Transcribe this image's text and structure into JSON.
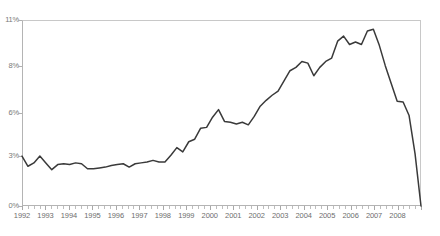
{
  "chart_data": {
    "type": "line",
    "title": "",
    "subtitle": "",
    "xlabel": "",
    "ylabel": "",
    "grid": false,
    "legend_position": "none",
    "line_color": "#3a3a3a",
    "axis_color": "#b4b4b4",
    "label_color": "#757575",
    "ylim": [
      0,
      11
    ],
    "ytick_labels": [
      "11%",
      "8%",
      "6%",
      "3%",
      "0%"
    ],
    "ytick_values": [
      11,
      8,
      6,
      3,
      0
    ],
    "ytick_pixel_y": [
      20,
      66,
      113,
      156,
      206
    ],
    "xtick_labels": [
      "1992",
      "1993",
      "1994",
      "1995",
      "1996",
      "1997",
      "1998",
      "1999",
      "2000",
      "2001",
      "2002",
      "2003",
      "2004",
      "2005",
      "2006",
      "2007",
      "2008"
    ],
    "x_minor_ticks_per_major": 4,
    "xlim": [
      "1992",
      "2008.75"
    ],
    "x": [
      1992.0,
      1992.25,
      1992.5,
      1992.75,
      1993.0,
      1993.25,
      1993.5,
      1993.75,
      1994.0,
      1994.25,
      1994.5,
      1994.75,
      1995.0,
      1995.25,
      1995.5,
      1995.75,
      1996.0,
      1996.25,
      1996.5,
      1996.75,
      1997.0,
      1997.25,
      1997.5,
      1997.75,
      1998.0,
      1998.25,
      1998.5,
      1998.75,
      1999.0,
      1999.25,
      1999.5,
      1999.75,
      2000.0,
      2000.25,
      2000.5,
      2000.75,
      2001.0,
      2001.25,
      2001.5,
      2001.75,
      2002.0,
      2002.25,
      2002.5,
      2002.75,
      2003.0,
      2003.25,
      2003.5,
      2003.75,
      2004.0,
      2004.25,
      2004.5,
      2004.75,
      2005.0,
      2005.25,
      2005.5,
      2005.75,
      2006.0,
      2006.25,
      2006.5,
      2006.75,
      2007.0,
      2007.25,
      2007.5,
      2007.75,
      2008.0,
      2008.25,
      2008.5,
      2008.75
    ],
    "values": [
      2.95,
      2.35,
      2.55,
      2.95,
      2.55,
      2.15,
      2.45,
      2.5,
      2.45,
      2.55,
      2.5,
      2.2,
      2.2,
      2.25,
      2.3,
      2.4,
      2.45,
      2.5,
      2.3,
      2.5,
      2.55,
      2.6,
      2.7,
      2.6,
      2.6,
      3.0,
      3.45,
      3.2,
      3.8,
      3.95,
      4.6,
      4.65,
      5.25,
      5.7,
      5.0,
      4.95,
      4.85,
      4.95,
      4.8,
      5.3,
      5.9,
      6.25,
      6.55,
      6.8,
      7.4,
      8.0,
      8.2,
      8.55,
      8.45,
      7.7,
      8.2,
      8.55,
      8.75,
      9.75,
      10.05,
      9.55,
      9.7,
      9.55,
      10.35,
      10.45,
      9.5,
      8.3,
      7.25,
      6.2,
      6.15,
      5.35,
      3.1,
      0.0
    ]
  }
}
